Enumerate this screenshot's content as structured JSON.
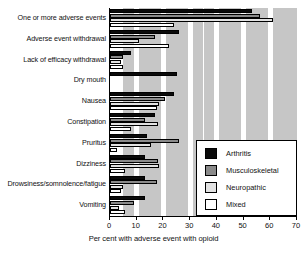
{
  "chart_data": {
    "type": "bar",
    "orientation": "horizontal",
    "title": "",
    "xlabel": "Per cent with adverse event with opioid",
    "ylabel": "",
    "xlim": [
      0,
      70
    ],
    "xticks": [
      0,
      10,
      20,
      30,
      40,
      50,
      60,
      70
    ],
    "grid": "vertical shaded bands",
    "legend_position": "lower right",
    "categories": [
      "One or more adverse events",
      "Adverse event withdrawal",
      "Lack of efficacy withdrawal",
      "Dry mouth",
      "Nausea",
      "Constipation",
      "Pruritus",
      "Dizziness",
      "Drowsiness/somnolence/fatigue",
      "Vomiting"
    ],
    "series": [
      {
        "name": "Arthritis",
        "color": "#0a0a0a",
        "values": [
          53,
          26,
          8,
          25,
          24,
          17,
          14,
          13,
          13,
          13
        ]
      },
      {
        "name": "Musculoskeletal",
        "color": "#8a8a8a",
        "values": [
          56,
          17,
          5,
          0,
          20.5,
          13,
          26,
          18,
          17.5,
          9
        ]
      },
      {
        "name": "Neuropathic",
        "color": "#e2e2e2",
        "values": [
          61,
          11,
          4,
          0,
          18.5,
          18,
          15.5,
          18.5,
          5,
          3.5
        ]
      },
      {
        "name": "Mixed",
        "color": "#ffffff",
        "values": [
          24,
          22,
          5,
          0,
          17.5,
          8,
          2.5,
          5.5,
          4,
          5.5
        ]
      }
    ]
  },
  "axis": {
    "tick_labels": [
      "0",
      "10",
      "20",
      "30",
      "40",
      "50",
      "60",
      "70"
    ],
    "xlabel": "Per cent with adverse event with opioid"
  },
  "legend": {
    "items": [
      {
        "label": "Arthritis",
        "swatch": "arthritis"
      },
      {
        "label": "Musculoskeletal",
        "swatch": "musculoskeletal"
      },
      {
        "label": "Neuropathic",
        "swatch": "neuropathic"
      },
      {
        "label": "Mixed",
        "swatch": "mixed"
      }
    ]
  }
}
